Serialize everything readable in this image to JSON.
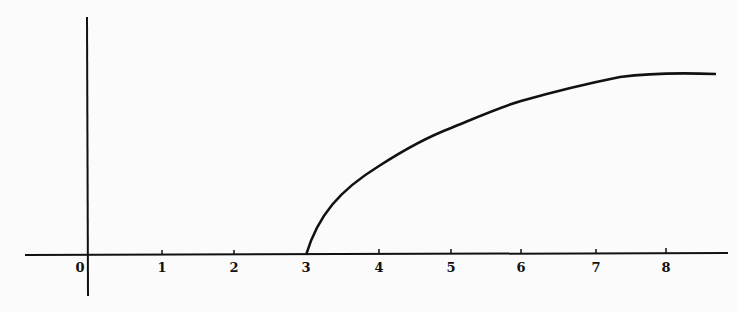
{
  "chart_data": {
    "type": "line",
    "title": "",
    "xlabel": "",
    "ylabel": "",
    "x_ticks": [
      "0",
      "1",
      "2",
      "3",
      "4",
      "5",
      "6",
      "7",
      "8"
    ],
    "xlim": [
      -0.9,
      8.7
    ],
    "grid": false,
    "legend": null,
    "series": [
      {
        "name": "curve",
        "x": [
          3,
          3.1,
          3.5,
          4,
          5,
          6,
          7,
          8,
          8.7
        ],
        "y": [
          0,
          0.14,
          0.38,
          0.48,
          0.7,
          0.85,
          0.95,
          1.0,
          1.0
        ]
      }
    ],
    "color": "#111111"
  }
}
